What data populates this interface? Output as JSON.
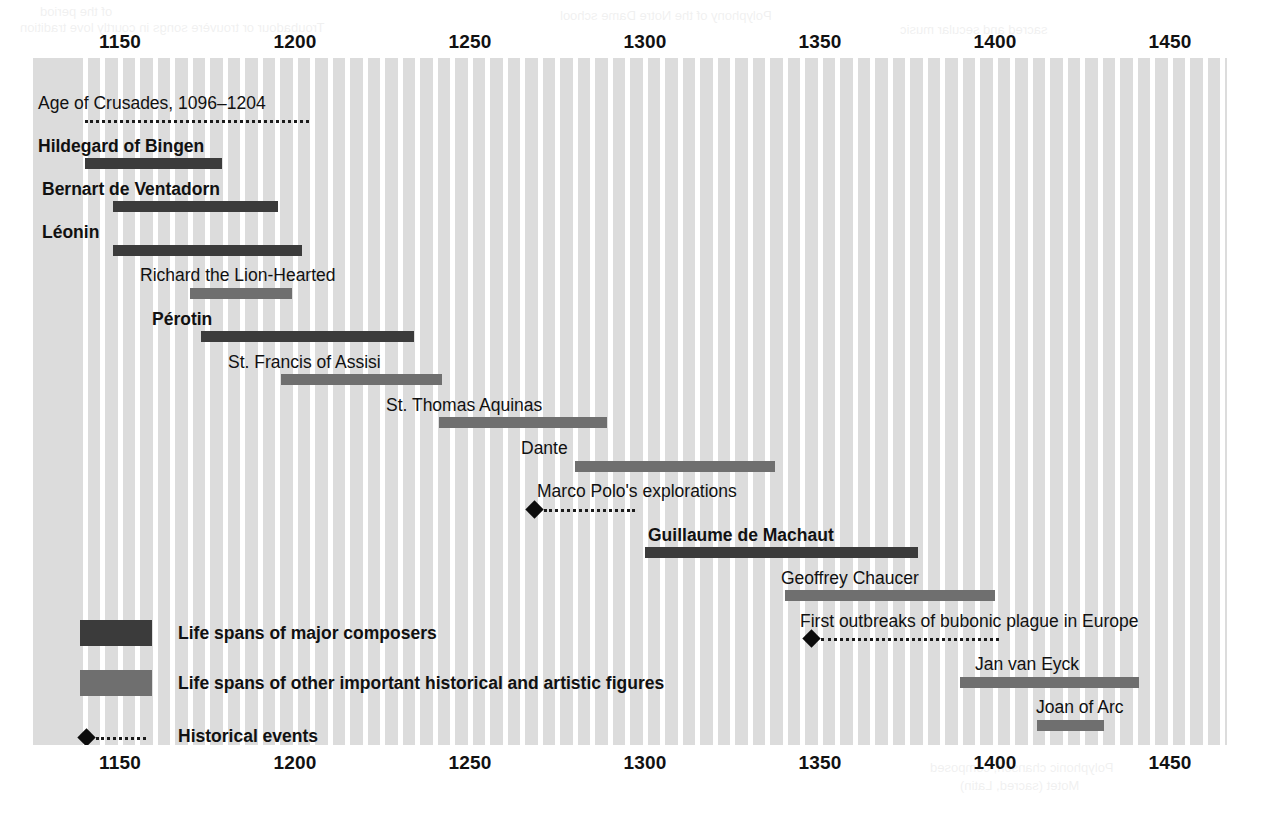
{
  "chart_data": {
    "type": "timeline",
    "title": "",
    "xlabel": "",
    "ylabel": "",
    "xlim": [
      1140,
      1481
    ],
    "grid": true,
    "grid_step_years": 5,
    "axis_ticks": [
      1150,
      1200,
      1250,
      1300,
      1350,
      1400,
      1450
    ],
    "axis_tick_labels": [
      "1150",
      "1200",
      "1250",
      "1300",
      "1350",
      "1400",
      "1450"
    ],
    "axis_positions": [
      "top",
      "bottom"
    ],
    "colors": {
      "composer_bar": "#3b3b3b",
      "figure_bar": "#6f6f6f",
      "event_marker": "#0d0d0d",
      "band": "#dcdcdc",
      "gridline": "#ffffff",
      "text": "#111111"
    },
    "categories": [
      "Age of Crusades, 1096–1204",
      "Hildegard of Bingen",
      "Bernart de Ventadorn",
      "Léonin",
      "Richard the Lion-Hearted",
      "Pérotin",
      "St. Francis of Assisi",
      "St. Thomas Aquinas",
      "Dante",
      "Marco Polo's explorations",
      "Guillaume de Machaut",
      "Geoffrey Chaucer",
      "First outbreaks of bubonic plague in Europe",
      "Jan van Eyck",
      "Joan of Arc"
    ],
    "rows": [
      {
        "label": "Age of Crusades, 1096–1204",
        "kind": "event",
        "style": "dotted-span",
        "bold": false,
        "start": 1140,
        "end": 1204,
        "row": 0,
        "label_x": 38,
        "marker": false
      },
      {
        "label": "Hildegard of Bingen",
        "kind": "composer",
        "bold": true,
        "start": 1140,
        "end": 1179,
        "row": 1,
        "label_x": 38
      },
      {
        "label": "Bernart de Ventadorn",
        "kind": "composer",
        "bold": true,
        "start": 1148,
        "end": 1195,
        "row": 2,
        "label_x": 42
      },
      {
        "label": "Léonin",
        "kind": "composer",
        "bold": true,
        "start": 1148,
        "end": 1202,
        "row": 3,
        "label_x": 42
      },
      {
        "label": "Richard the Lion-Hearted",
        "kind": "figure",
        "bold": false,
        "start": 1170,
        "end": 1199,
        "row": 4,
        "label_x": 140
      },
      {
        "label": "Pérotin",
        "kind": "composer",
        "bold": true,
        "start": 1173,
        "end": 1234,
        "row": 5,
        "label_x": 152
      },
      {
        "label": "St. Francis of Assisi",
        "kind": "figure",
        "bold": false,
        "start": 1196,
        "end": 1242,
        "row": 6,
        "label_x": 228
      },
      {
        "label": "St. Thomas Aquinas",
        "kind": "figure",
        "bold": false,
        "start": 1241,
        "end": 1289,
        "row": 7,
        "label_x": 386
      },
      {
        "label": "Dante",
        "kind": "figure",
        "bold": false,
        "start": 1280,
        "end": 1337,
        "row": 8,
        "label_x": 521
      },
      {
        "label": "Marco Polo's explorations",
        "kind": "event",
        "style": "dotted-span",
        "bold": false,
        "start": 1268,
        "end": 1297,
        "row": 9,
        "label_x": 537,
        "marker": true
      },
      {
        "label": "Guillaume de Machaut",
        "kind": "composer",
        "bold": true,
        "start": 1300,
        "end": 1378,
        "row": 10,
        "label_x": 648
      },
      {
        "label": "Geoffrey Chaucer",
        "kind": "figure",
        "bold": false,
        "start": 1340,
        "end": 1400,
        "row": 11,
        "label_x": 781
      },
      {
        "label": "First outbreaks of bubonic plague in Europe",
        "kind": "event",
        "style": "dotted-span",
        "bold": false,
        "start": 1347,
        "end": 1401,
        "row": 12,
        "label_x": 800,
        "marker": true
      },
      {
        "label": "Jan van Eyck",
        "kind": "figure",
        "bold": false,
        "start": 1390,
        "end": 1441,
        "row": 13,
        "label_x": 975
      },
      {
        "label": "Joan of Arc",
        "kind": "figure",
        "bold": false,
        "start": 1412,
        "end": 1431,
        "row": 14,
        "label_x": 1036
      }
    ]
  },
  "legend": {
    "items": [
      {
        "type": "composer",
        "label": "Life spans of major composers"
      },
      {
        "type": "figure",
        "label": "Life spans of other important historical and artistic figures"
      },
      {
        "type": "event",
        "label": "Historical events"
      }
    ]
  },
  "bleed_through": [
    {
      "text": "of the period",
      "x": 40,
      "y": 4
    },
    {
      "text": "Troubadour or trouvère songs in courtly love tradition",
      "x": 20,
      "y": 20
    },
    {
      "text": "Polyphony of the Notre Dame school",
      "x": 560,
      "y": 8
    },
    {
      "text": "sacred and secular music",
      "x": 900,
      "y": 22
    },
    {
      "text": "Polyphonic chanson, composed",
      "x": 930,
      "y": 760
    },
    {
      "text": "Motet (sacred, Latin)",
      "x": 960,
      "y": 778
    }
  ]
}
